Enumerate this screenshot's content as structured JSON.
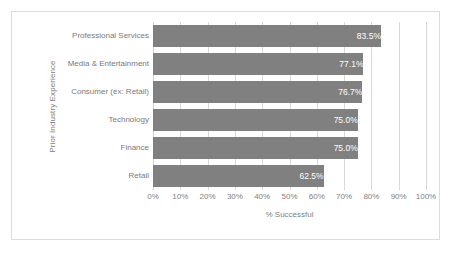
{
  "chart_data": {
    "type": "bar",
    "orientation": "horizontal",
    "title": "",
    "categories": [
      "Professional Services",
      "Media & Entertainment",
      "Consumer (ex: Retail)",
      "Technology",
      "Finance",
      "Retail"
    ],
    "values": [
      83.5,
      77.1,
      76.7,
      75.0,
      75.0,
      62.5
    ],
    "data_labels": [
      "83.5%",
      "77.1%",
      "76.7%",
      "75.0%",
      "75.0%",
      "62.5%"
    ],
    "xlabel": "% Successful",
    "ylabel": "Prior Industry Experience",
    "xlim": [
      0,
      100
    ],
    "xticks": [
      0,
      10,
      20,
      30,
      40,
      50,
      60,
      70,
      80,
      90,
      100
    ],
    "xtick_labels": [
      "0%",
      "10%",
      "20%",
      "30%",
      "40%",
      "50%",
      "60%",
      "70%",
      "80%",
      "90%",
      "100%"
    ],
    "grid": "vertical",
    "legend": "none",
    "bar_color": "#808080",
    "gridline_color": "#d9d9d9",
    "label_color": "#808080",
    "data_label_color": "#ffffff",
    "border_color": "#dcdcdc",
    "background_color": "#ffffff"
  }
}
